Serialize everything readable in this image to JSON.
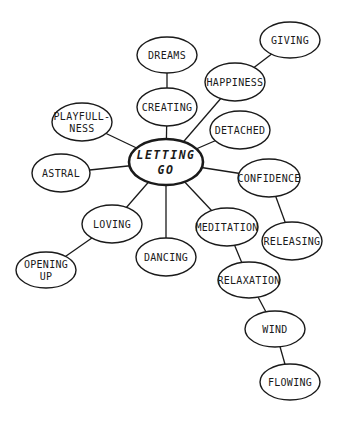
{
  "diagram": {
    "type": "mind-map",
    "center": {
      "id": "letting_go",
      "lines": [
        "LETTING",
        "GO"
      ],
      "x": 166,
      "y": 162,
      "rx": 37,
      "ry": 23
    },
    "nodes": [
      {
        "id": "dreams",
        "lines": [
          "DREAMS"
        ],
        "x": 167,
        "y": 55,
        "rx": 30,
        "ry": 18
      },
      {
        "id": "creating",
        "lines": [
          "CREATING"
        ],
        "x": 167,
        "y": 107,
        "rx": 30,
        "ry": 19
      },
      {
        "id": "giving",
        "lines": [
          "GIVING"
        ],
        "x": 290,
        "y": 40,
        "rx": 30,
        "ry": 18
      },
      {
        "id": "happiness",
        "lines": [
          "HAPPINESS"
        ],
        "x": 235,
        "y": 82,
        "rx": 30,
        "ry": 19
      },
      {
        "id": "detached",
        "lines": [
          "DETACHED"
        ],
        "x": 240,
        "y": 130,
        "rx": 30,
        "ry": 19
      },
      {
        "id": "playfulness",
        "lines": [
          "PLAYFULL-",
          "NESS"
        ],
        "x": 82,
        "y": 122,
        "rx": 30,
        "ry": 19
      },
      {
        "id": "astral",
        "lines": [
          "ASTRAL"
        ],
        "x": 61,
        "y": 173,
        "rx": 29,
        "ry": 19
      },
      {
        "id": "confidence",
        "lines": [
          "CONFIDENCE"
        ],
        "x": 269,
        "y": 178,
        "rx": 31,
        "ry": 19
      },
      {
        "id": "releasing",
        "lines": [
          "RELEASING"
        ],
        "x": 292,
        "y": 241,
        "rx": 30,
        "ry": 19
      },
      {
        "id": "loving",
        "lines": [
          "LOVING"
        ],
        "x": 112,
        "y": 224,
        "rx": 30,
        "ry": 19
      },
      {
        "id": "opening_up",
        "lines": [
          "OPENING",
          "UP"
        ],
        "x": 46,
        "y": 270,
        "rx": 30,
        "ry": 18
      },
      {
        "id": "dancing",
        "lines": [
          "DANCING"
        ],
        "x": 166,
        "y": 257,
        "rx": 30,
        "ry": 19
      },
      {
        "id": "meditation",
        "lines": [
          "MEDITATION"
        ],
        "x": 227,
        "y": 227,
        "rx": 31,
        "ry": 19
      },
      {
        "id": "relaxation",
        "lines": [
          "RELAXATION"
        ],
        "x": 249,
        "y": 280,
        "rx": 31,
        "ry": 18
      },
      {
        "id": "wind",
        "lines": [
          "WIND"
        ],
        "x": 275,
        "y": 329,
        "rx": 30,
        "ry": 18
      },
      {
        "id": "flowing",
        "lines": [
          "FLOWING"
        ],
        "x": 290,
        "y": 382,
        "rx": 30,
        "ry": 18
      }
    ],
    "edges": [
      [
        "letting_go",
        "creating"
      ],
      [
        "creating",
        "dreams"
      ],
      [
        "letting_go",
        "happiness"
      ],
      [
        "happiness",
        "giving"
      ],
      [
        "letting_go",
        "detached"
      ],
      [
        "letting_go",
        "playfulness"
      ],
      [
        "letting_go",
        "astral"
      ],
      [
        "letting_go",
        "confidence"
      ],
      [
        "confidence",
        "releasing"
      ],
      [
        "letting_go",
        "loving"
      ],
      [
        "loving",
        "opening_up"
      ],
      [
        "letting_go",
        "dancing"
      ],
      [
        "letting_go",
        "meditation"
      ],
      [
        "meditation",
        "relaxation"
      ],
      [
        "relaxation",
        "wind"
      ],
      [
        "wind",
        "flowing"
      ]
    ]
  }
}
